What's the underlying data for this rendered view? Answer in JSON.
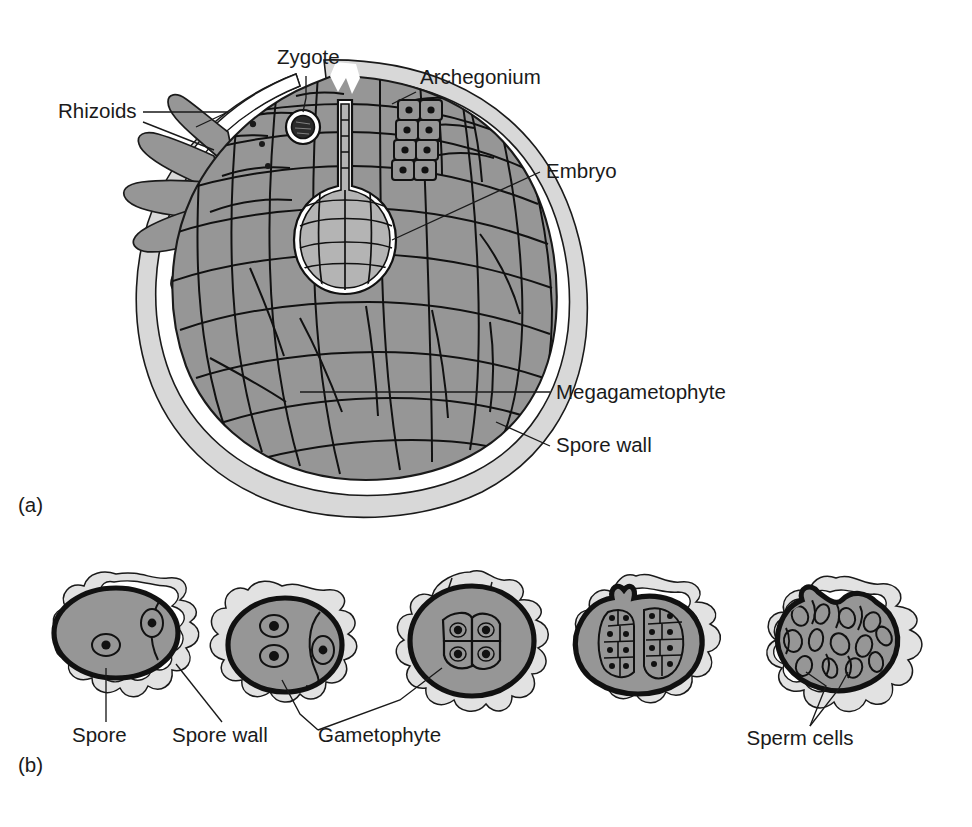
{
  "figure": {
    "background": "#ffffff",
    "panels": [
      {
        "id": "a",
        "label": "(a)",
        "x": 18,
        "y": 512
      },
      {
        "id": "b",
        "label": "(b)",
        "x": 18,
        "y": 772
      }
    ]
  },
  "colors": {
    "tissue_gray": "#969696",
    "embryo_gray": "#b4b4b4",
    "spore_wall_gray": "#d8d8d8",
    "outline_black": "#111111",
    "nucleus_black": "#1a1a1a",
    "white": "#ffffff",
    "text": "#1a1a1a"
  },
  "panel_a": {
    "title": "Megagametophyte with embryo inside spore wall",
    "labels": [
      {
        "name": "rhizoids",
        "text": "Rhizoids",
        "x": 58,
        "y": 118,
        "anchor": "start"
      },
      {
        "name": "zygote",
        "text": "Zygote",
        "x": 277,
        "y": 64,
        "anchor": "start"
      },
      {
        "name": "archegonium",
        "text": "Archegonium",
        "x": 420,
        "y": 84,
        "anchor": "start"
      },
      {
        "name": "embryo",
        "text": "Embryo",
        "x": 546,
        "y": 178,
        "anchor": "start"
      },
      {
        "name": "megagametophyte",
        "text": "Megagametophyte",
        "x": 556,
        "y": 399,
        "anchor": "start"
      },
      {
        "name": "spore-wall",
        "text": "Spore wall",
        "x": 556,
        "y": 452,
        "anchor": "start"
      }
    ],
    "structures": [
      "spore-wall",
      "megagametophyte-tissue",
      "rhizoids",
      "archegonium",
      "zygote",
      "embryo"
    ]
  },
  "panel_b": {
    "title": "Development series of microspore into male gametophyte",
    "stages": [
      {
        "index": 1,
        "name": "spore-single-cell",
        "contents": "1 nucleus plus small prothallial cell"
      },
      {
        "index": 2,
        "name": "spore-two-nuclei",
        "contents": "2 nuclei plus prothallial cell"
      },
      {
        "index": 3,
        "name": "spore-four-celled",
        "contents": "4-celled gametophyte"
      },
      {
        "index": 4,
        "name": "spore-antheridia",
        "contents": "two multicellular antheridia"
      },
      {
        "index": 5,
        "name": "spore-sperm-cells",
        "contents": "mature sperm cells"
      }
    ],
    "labels": [
      {
        "name": "spore",
        "text": "Spore",
        "x": 72,
        "y": 742,
        "anchor": "start"
      },
      {
        "name": "spore-wall",
        "text": "Spore wall",
        "x": 172,
        "y": 742,
        "anchor": "start"
      },
      {
        "name": "gametophyte",
        "text": "Gametophyte",
        "x": 318,
        "y": 742,
        "anchor": "start"
      },
      {
        "name": "sperm-cells",
        "text": "Sperm cells",
        "x": 800,
        "y": 745,
        "anchor": "middle"
      }
    ]
  }
}
